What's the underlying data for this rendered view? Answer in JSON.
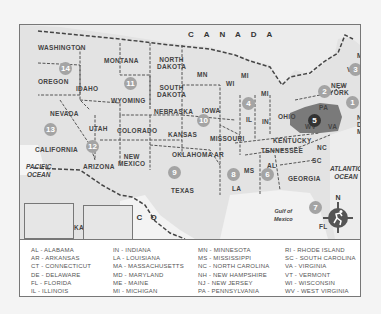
{
  "map": {
    "title_country_north": "C A N A D A",
    "title_country_south": "M E X I C O",
    "oceans": {
      "pacific": "PACIFIC\nOCEAN",
      "atlantic": "ATLANTIC\nOCEAN",
      "gulf": "Gulf of\nMexico"
    },
    "state_labels": [
      {
        "text": "WASHINGTON",
        "x": 18,
        "y": 19
      },
      {
        "text": "OREGON",
        "x": 18,
        "y": 53
      },
      {
        "text": "IDAHO",
        "x": 56,
        "y": 60
      },
      {
        "text": "MONTANA",
        "x": 84,
        "y": 32
      },
      {
        "text": "WYOMING",
        "x": 91,
        "y": 72
      },
      {
        "text": "NEVADA",
        "x": 30,
        "y": 85
      },
      {
        "text": "UTAH",
        "x": 69,
        "y": 100
      },
      {
        "text": "COLORADO",
        "x": 97,
        "y": 102
      },
      {
        "text": "CALIFORNIA",
        "x": 15,
        "y": 121
      },
      {
        "text": "ARIZONA",
        "x": 63,
        "y": 138
      },
      {
        "text": "NEW\nMEXICO",
        "x": 98,
        "y": 128
      },
      {
        "text": "NORTH\nDAKOTA",
        "x": 137,
        "y": 31
      },
      {
        "text": "SOUTH\nDAKOTA",
        "x": 137,
        "y": 59
      },
      {
        "text": "NEBRASKA",
        "x": 134,
        "y": 83
      },
      {
        "text": "KANSAS",
        "x": 148,
        "y": 106
      },
      {
        "text": "OKLAHOMA",
        "x": 152,
        "y": 126
      },
      {
        "text": "TEXAS",
        "x": 151,
        "y": 162
      },
      {
        "text": "MN",
        "x": 177,
        "y": 46
      },
      {
        "text": "IOWA",
        "x": 182,
        "y": 82
      },
      {
        "text": "MISSOURI",
        "x": 190,
        "y": 110
      },
      {
        "text": "AR",
        "x": 194,
        "y": 126
      },
      {
        "text": "LA",
        "x": 212,
        "y": 160
      },
      {
        "text": "MS",
        "x": 224,
        "y": 142
      },
      {
        "text": "WI",
        "x": 206,
        "y": 55
      },
      {
        "text": "MI",
        "x": 221,
        "y": 47
      },
      {
        "text": "MI",
        "x": 241,
        "y": 65
      },
      {
        "text": "IL",
        "x": 226,
        "y": 91
      },
      {
        "text": "IN",
        "x": 242,
        "y": 93
      },
      {
        "text": "OHIO",
        "x": 258,
        "y": 88
      },
      {
        "text": "KENTUCKY",
        "x": 253,
        "y": 112
      },
      {
        "text": "TENNESSEE",
        "x": 241,
        "y": 122
      },
      {
        "text": "AL",
        "x": 247,
        "y": 137
      },
      {
        "text": "GEORGIA",
        "x": 268,
        "y": 150
      },
      {
        "text": "SC",
        "x": 292,
        "y": 132
      },
      {
        "text": "NC",
        "x": 297,
        "y": 119
      },
      {
        "text": "FL",
        "x": 299,
        "y": 198
      },
      {
        "text": "WV",
        "x": 285,
        "y": 98
      },
      {
        "text": "VA",
        "x": 308,
        "y": 98
      },
      {
        "text": "PA",
        "x": 299,
        "y": 79
      },
      {
        "text": "NEW\nYORK",
        "x": 309,
        "y": 57
      },
      {
        "text": "VT",
        "x": 327,
        "y": 41
      },
      {
        "text": "ME",
        "x": 337,
        "y": 27
      },
      {
        "text": "NH",
        "x": 347,
        "y": 42
      },
      {
        "text": "MA",
        "x": 344,
        "y": 55
      },
      {
        "text": "RI",
        "x": 349,
        "y": 66
      },
      {
        "text": "CT",
        "x": 344,
        "y": 74
      },
      {
        "text": "NJ",
        "x": 337,
        "y": 89
      },
      {
        "text": "DE",
        "x": 337,
        "y": 96
      },
      {
        "text": "MD",
        "x": 337,
        "y": 103
      },
      {
        "text": "ALASKA",
        "x": 35,
        "y": 199
      },
      {
        "text": "HAWAII",
        "x": 86,
        "y": 184
      }
    ],
    "region_badges": [
      {
        "num": "1",
        "x": 332,
        "y": 77,
        "dark": false
      },
      {
        "num": "2",
        "x": 304,
        "y": 66,
        "dark": false
      },
      {
        "num": "3",
        "x": 335,
        "y": 44,
        "dark": false
      },
      {
        "num": "4",
        "x": 228,
        "y": 78,
        "dark": false
      },
      {
        "num": "5",
        "x": 294,
        "y": 95,
        "dark": true
      },
      {
        "num": "6",
        "x": 247,
        "y": 149,
        "dark": false
      },
      {
        "num": "7",
        "x": 295,
        "y": 182,
        "dark": false
      },
      {
        "num": "8",
        "x": 213,
        "y": 149,
        "dark": false
      },
      {
        "num": "9",
        "x": 154,
        "y": 147,
        "dark": false
      },
      {
        "num": "10",
        "x": 183,
        "y": 95,
        "dark": false
      },
      {
        "num": "11",
        "x": 110,
        "y": 58,
        "dark": false
      },
      {
        "num": "12",
        "x": 72,
        "y": 121,
        "dark": false
      },
      {
        "num": "13",
        "x": 30,
        "y": 104,
        "dark": false
      },
      {
        "num": "14",
        "x": 45,
        "y": 43,
        "dark": false
      },
      {
        "num": "15",
        "x": 38,
        "y": 188,
        "dark": false
      },
      {
        "num": "16",
        "x": 93,
        "y": 205,
        "dark": false
      }
    ],
    "compass": {
      "north_label": "N"
    }
  },
  "legend": {
    "columns": [
      [
        "AL  -  ALABAMA",
        "AR  -  ARKANSAS",
        "CT  - CONNECTICUT",
        "DE  -  DELAWARE",
        "FL -  FLORIDA",
        "IL  -  ILLINOIS"
      ],
      [
        "IN  -  INDIANA",
        "LA  -  LOUISIANA",
        "MA -  MASSACHUSETTS",
        "MD -  MARYLAND",
        "ME  -  MAINE",
        "MI  -  MICHIGAN"
      ],
      [
        "MN  -  MINNESOTA",
        "MS  -  MISSISSIPPI",
        "NC  -  NORTH CAROLINA",
        "NH  -  NEW HAMPSHIRE",
        "NJ  -  NEW JERSEY",
        "PA  -  PENNSYLVANIA"
      ],
      [
        "RI  -  RHODE ISLAND",
        "SC  -  SOUTH CAROLINA",
        "VA  -  VIRGINIA",
        "VT  -  VERMONT",
        "WI  -  WISCONSIN",
        "WV  -  WEST VIRGINIA"
      ]
    ]
  },
  "colors": {
    "land": "#e0e0e0",
    "water": "#ffffff",
    "border": "#555555",
    "badge": "#a4a4a4",
    "highlight_region": "#7a7a7a",
    "badge_highlight": "#333333"
  }
}
